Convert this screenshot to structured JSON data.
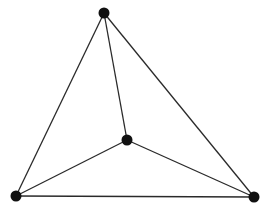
{
  "diagram": {
    "type": "graph",
    "colors": {
      "background": "#ffffff",
      "edge": "#2a2a2a",
      "node": "#111111"
    },
    "nodes": [
      {
        "id": "top",
        "x": 104,
        "y": 13
      },
      {
        "id": "center",
        "x": 127,
        "y": 140
      },
      {
        "id": "bottom-left",
        "x": 16,
        "y": 196
      },
      {
        "id": "bottom-right",
        "x": 254,
        "y": 197
      }
    ],
    "edges": [
      [
        "top",
        "bottom-left"
      ],
      [
        "top",
        "bottom-right"
      ],
      [
        "top",
        "center"
      ],
      [
        "center",
        "bottom-left"
      ],
      [
        "center",
        "bottom-right"
      ],
      [
        "bottom-left",
        "bottom-right"
      ]
    ]
  }
}
